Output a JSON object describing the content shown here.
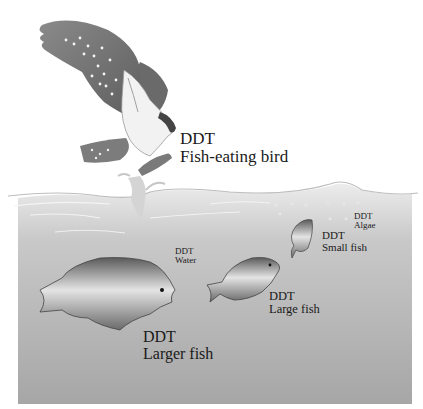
{
  "diagram": {
    "labels": {
      "bird": {
        "line1": "DDT",
        "line2": "Fish-eating bird"
      },
      "algae": {
        "line1": "DDT",
        "line2": "Algae"
      },
      "small_fish": {
        "line1": "DDT",
        "line2": "Small fish"
      },
      "water": {
        "line1": "DDT",
        "line2": "Water"
      },
      "large_fish": {
        "line1": "DDT",
        "line2": "Large fish"
      },
      "larger_fish": {
        "line1": "DDT",
        "line2": "Larger fish"
      }
    },
    "colors": {
      "water_top": "#e2e2e2",
      "water_bottom": "#a9a9a9",
      "bird_dark": "#6e6e6e",
      "fish_dark": "#555555",
      "fish_light": "#d8d8d8"
    }
  }
}
